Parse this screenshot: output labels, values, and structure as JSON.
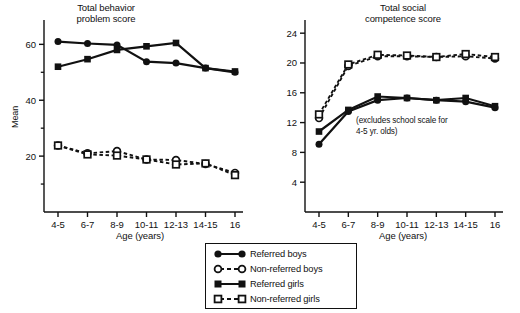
{
  "figure": {
    "width": 520,
    "height": 313,
    "background": "#ffffff",
    "ink_color": "#111111"
  },
  "legend": {
    "name": "series-legend",
    "entries": [
      {
        "label": "Referred boys",
        "marker": "filled-circle",
        "line": "solid"
      },
      {
        "label": "Non-referred boys",
        "marker": "open-circle",
        "line": "dashed"
      },
      {
        "label": "Referred girls",
        "marker": "filled-square",
        "line": "solid"
      },
      {
        "label": "Non-referred girls",
        "marker": "open-square",
        "line": "dashed"
      }
    ]
  },
  "chart_data": [
    {
      "id": "total-behavior-problem-score",
      "type": "line",
      "title": "Total behavior\nproblem score",
      "xlabel": "Age (years)",
      "ylabel": "Mean",
      "categories": [
        "4-5",
        "6-7",
        "8-9",
        "10-11",
        "12-13",
        "14-15",
        "16"
      ],
      "ylim": [
        0,
        68
      ],
      "yticks": [
        20,
        40,
        60
      ],
      "yticks_minor": [
        10,
        30,
        50,
        70
      ],
      "grid": false,
      "legend_position": "below-figure-center",
      "series": [
        {
          "name": "Referred boys",
          "marker": "filled-circle",
          "line": "solid",
          "values": [
            61.0,
            60.3,
            59.8,
            53.8,
            53.3,
            51.5,
            50.0
          ]
        },
        {
          "name": "Referred girls",
          "marker": "filled-square",
          "line": "solid",
          "values": [
            52.0,
            54.7,
            58.0,
            59.3,
            60.5,
            51.5,
            50.3
          ]
        },
        {
          "name": "Non-referred boys",
          "marker": "open-circle",
          "line": "dashed",
          "values": [
            23.8,
            21.0,
            21.8,
            18.8,
            18.6,
            17.2,
            14.0
          ]
        },
        {
          "name": "Non-referred girls",
          "marker": "open-square",
          "line": "dashed",
          "values": [
            23.8,
            20.6,
            20.2,
            18.8,
            17.0,
            17.4,
            13.2
          ]
        }
      ]
    },
    {
      "id": "total-social-competence-score",
      "type": "line",
      "title": "Total social\ncompetence score",
      "xlabel": "Age (years)",
      "ylabel": "Mean",
      "annotation": "(excludes school scale for\n4-5 yr. olds)",
      "categories": [
        "4-5",
        "6-7",
        "8-9",
        "10-11",
        "12-13",
        "14-15",
        "16"
      ],
      "ylim": [
        0,
        25.5
      ],
      "yticks": [
        4,
        8,
        12,
        16,
        20,
        24
      ],
      "grid": false,
      "legend_position": "below-figure-center",
      "series": [
        {
          "name": "Referred boys",
          "marker": "filled-circle",
          "line": "solid",
          "values": [
            9.1,
            13.5,
            15.0,
            15.3,
            15.0,
            14.8,
            14.0
          ]
        },
        {
          "name": "Referred girls",
          "marker": "filled-square",
          "line": "solid",
          "values": [
            10.8,
            13.7,
            15.5,
            15.3,
            15.0,
            15.3,
            14.2
          ]
        },
        {
          "name": "Non-referred boys",
          "marker": "open-circle",
          "line": "dashed",
          "values": [
            12.6,
            19.6,
            20.9,
            20.9,
            20.8,
            20.9,
            20.6
          ]
        },
        {
          "name": "Non-referred girls",
          "marker": "open-square",
          "line": "dashed",
          "values": [
            13.1,
            19.8,
            21.1,
            21.0,
            20.8,
            21.2,
            20.8
          ]
        }
      ]
    }
  ]
}
